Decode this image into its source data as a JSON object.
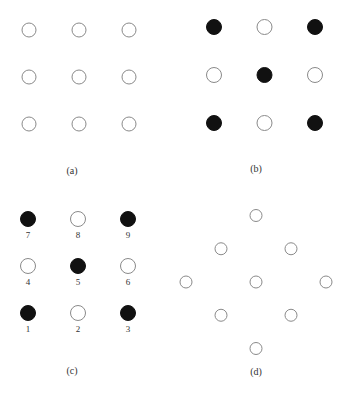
{
  "figure": {
    "panels": [
      {
        "id": "a",
        "label": "(a)",
        "layout": "grid-3x3",
        "cells": [
          {
            "row": 0,
            "col": 0,
            "filled": false
          },
          {
            "row": 0,
            "col": 1,
            "filled": false
          },
          {
            "row": 0,
            "col": 2,
            "filled": false
          },
          {
            "row": 1,
            "col": 0,
            "filled": false
          },
          {
            "row": 1,
            "col": 1,
            "filled": false
          },
          {
            "row": 1,
            "col": 2,
            "filled": false
          },
          {
            "row": 2,
            "col": 0,
            "filled": false
          },
          {
            "row": 2,
            "col": 1,
            "filled": false
          },
          {
            "row": 2,
            "col": 2,
            "filled": false
          }
        ]
      },
      {
        "id": "b",
        "label": "(b)",
        "layout": "grid-3x3",
        "cells": [
          {
            "row": 0,
            "col": 0,
            "filled": true
          },
          {
            "row": 0,
            "col": 1,
            "filled": false
          },
          {
            "row": 0,
            "col": 2,
            "filled": true
          },
          {
            "row": 1,
            "col": 0,
            "filled": false
          },
          {
            "row": 1,
            "col": 1,
            "filled": true
          },
          {
            "row": 1,
            "col": 2,
            "filled": false
          },
          {
            "row": 2,
            "col": 0,
            "filled": true
          },
          {
            "row": 2,
            "col": 1,
            "filled": false
          },
          {
            "row": 2,
            "col": 2,
            "filled": true
          }
        ]
      },
      {
        "id": "c",
        "label": "(c)",
        "layout": "grid-3x3-numbered",
        "cells": [
          {
            "row": 0,
            "col": 0,
            "filled": true,
            "number": "7"
          },
          {
            "row": 0,
            "col": 1,
            "filled": false,
            "number": "8"
          },
          {
            "row": 0,
            "col": 2,
            "filled": true,
            "number": "9"
          },
          {
            "row": 1,
            "col": 0,
            "filled": false,
            "number": "4"
          },
          {
            "row": 1,
            "col": 1,
            "filled": true,
            "number": "5"
          },
          {
            "row": 1,
            "col": 2,
            "filled": false,
            "number": "6"
          },
          {
            "row": 2,
            "col": 0,
            "filled": true,
            "number": "1"
          },
          {
            "row": 2,
            "col": 1,
            "filled": false,
            "number": "2"
          },
          {
            "row": 2,
            "col": 2,
            "filled": true,
            "number": "3"
          }
        ]
      },
      {
        "id": "d",
        "label": "(d)",
        "layout": "diamond-rotated-grid",
        "cells": [
          {
            "row": 0,
            "col": 0,
            "filled": false
          },
          {
            "row": 0,
            "col": 1,
            "filled": false
          },
          {
            "row": 0,
            "col": 2,
            "filled": false
          },
          {
            "row": 1,
            "col": 0,
            "filled": false
          },
          {
            "row": 1,
            "col": 1,
            "filled": false
          },
          {
            "row": 1,
            "col": 2,
            "filled": false
          },
          {
            "row": 2,
            "col": 0,
            "filled": false
          },
          {
            "row": 2,
            "col": 1,
            "filled": false
          },
          {
            "row": 2,
            "col": 2,
            "filled": false
          }
        ]
      }
    ],
    "colors": {
      "filled": "#111111",
      "stroke": "#8a8a8a",
      "text": "#333333"
    }
  }
}
